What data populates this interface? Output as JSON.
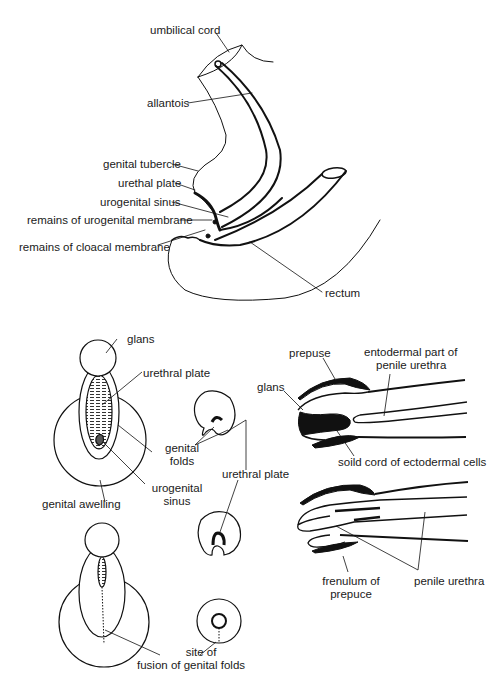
{
  "figure": {
    "top_panel": {
      "title": "Sagittal view of cloacal region",
      "labels": {
        "umbilical_cord": "umbilical cord",
        "allantois": "allantois",
        "genital_tubercle": "genital tubercle",
        "urethal_plate": "urethal plate",
        "urogenital_sinus": "urogenital sinus",
        "remains_urogenital_membrane": "remains of urogenital membrane",
        "remains_cloacal_membrane": "remains of cloacal membrane",
        "rectum": "rectum"
      }
    },
    "bottom_left_panel": {
      "labels": {
        "glans": "glans",
        "urethral_plate": "urethral plate",
        "genital_folds_1": "genital",
        "genital_folds_2": "folds",
        "urogenital_sinus_1": "urogenital",
        "urogenital_sinus_2": "sinus",
        "genital_swelling": "genital awelling",
        "urethral_plate_cross": "urethral plate",
        "site_fusion_1": "site of",
        "site_fusion_2": "fusion of genital folds"
      }
    },
    "bottom_right_panel": {
      "labels": {
        "prepuse": "prepuse",
        "entodermal_1": "entodermal part of",
        "entodermal_2": "penile urethra",
        "glans": "glans",
        "solid_cord": "soild cord of ectodermal cells",
        "frenulum_1": "frenulum of",
        "frenulum_2": "prepuce",
        "penile_urethra": "penile urethra",
        "signature": "e.k."
      }
    },
    "colors": {
      "ink": "#111111",
      "background": "#ffffff",
      "hatching": "#333333"
    }
  }
}
